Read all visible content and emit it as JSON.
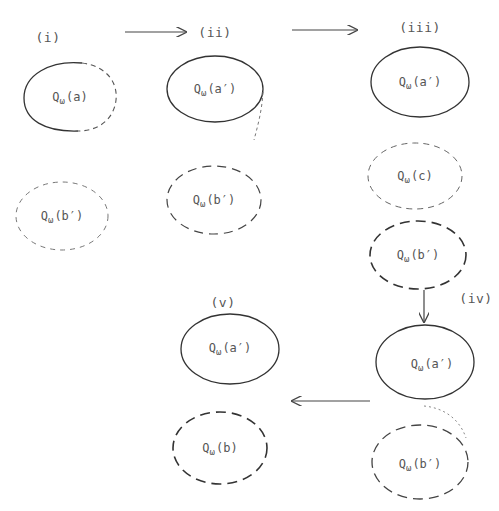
{
  "diagram": {
    "stages": [
      {
        "id": "i",
        "label": "(i)",
        "x": 48,
        "y": 37
      },
      {
        "id": "ii",
        "label": "(ii)",
        "x": 215,
        "y": 32
      },
      {
        "id": "iii",
        "label": "(iii)",
        "x": 420,
        "y": 27
      },
      {
        "id": "iv",
        "label": "(iv)",
        "x": 476,
        "y": 298
      },
      {
        "id": "v",
        "label": "(v)",
        "x": 223,
        "y": 302
      }
    ],
    "nodes": [
      {
        "id": "i-a",
        "stage": "i",
        "q": "Q",
        "sub": "ω",
        "arg": "(a)",
        "style": "solid-left-dashed-right",
        "cx": 70,
        "cy": 97,
        "rx": 46,
        "ry": 34
      },
      {
        "id": "i-b",
        "stage": "i",
        "q": "Q",
        "sub": "ω",
        "arg": "(b′)",
        "style": "dashed-light",
        "cx": 62,
        "cy": 216,
        "rx": 46,
        "ry": 34
      },
      {
        "id": "ii-a",
        "stage": "ii",
        "q": "Q",
        "sub": "ω",
        "arg": "(a′)",
        "style": "solid",
        "cx": 215,
        "cy": 89,
        "rx": 48,
        "ry": 33
      },
      {
        "id": "ii-b",
        "stage": "ii",
        "q": "Q",
        "sub": "ω",
        "arg": "(b′)",
        "style": "dashed",
        "cx": 214,
        "cy": 200,
        "rx": 47,
        "ry": 34
      },
      {
        "id": "iii-a",
        "stage": "iii",
        "q": "Q",
        "sub": "ω",
        "arg": "(a′)",
        "style": "solid",
        "cx": 420,
        "cy": 82,
        "rx": 49,
        "ry": 35
      },
      {
        "id": "iii-c",
        "stage": "iii",
        "q": "Q",
        "sub": "ω",
        "arg": "(c)",
        "style": "dashed-light",
        "cx": 415,
        "cy": 176,
        "rx": 47,
        "ry": 33
      },
      {
        "id": "iii-b",
        "stage": "iii",
        "q": "Q",
        "sub": "ω",
        "arg": "(b′)",
        "style": "dashed-bold",
        "cx": 418,
        "cy": 255,
        "rx": 48,
        "ry": 34
      },
      {
        "id": "iv-a",
        "stage": "iv",
        "q": "Q",
        "sub": "ω",
        "arg": "(a′)",
        "style": "solid",
        "cx": 425,
        "cy": 362,
        "rx": 49,
        "ry": 37
      },
      {
        "id": "iv-b",
        "stage": "iv",
        "q": "Q",
        "sub": "ω",
        "arg": "(b′)",
        "style": "dashed",
        "cx": 420,
        "cy": 462,
        "rx": 48,
        "ry": 37
      },
      {
        "id": "v-a",
        "stage": "v",
        "q": "Q",
        "sub": "ω",
        "arg": "(a′)",
        "style": "solid",
        "cx": 230,
        "cy": 349,
        "rx": 49,
        "ry": 35
      },
      {
        "id": "v-b",
        "stage": "v",
        "q": "Q",
        "sub": "ω",
        "arg": "(b)",
        "style": "dashed-bold",
        "cx": 220,
        "cy": 448,
        "rx": 47,
        "ry": 36
      }
    ],
    "arrows": [
      {
        "id": "i-to-ii",
        "from": "i",
        "to": "ii",
        "x1": 125,
        "y1": 32,
        "x2": 186,
        "y2": 32
      },
      {
        "id": "ii-to-iii",
        "from": "ii",
        "to": "iii",
        "x1": 292,
        "y1": 30,
        "x2": 357,
        "y2": 30
      },
      {
        "id": "iii-to-iv",
        "from": "iii",
        "to": "iv",
        "x1": 424,
        "y1": 290,
        "x2": 424,
        "y2": 322
      },
      {
        "id": "iv-to-v",
        "from": "iv",
        "to": "v",
        "x1": 370,
        "y1": 401,
        "x2": 292,
        "y2": 401
      }
    ]
  }
}
